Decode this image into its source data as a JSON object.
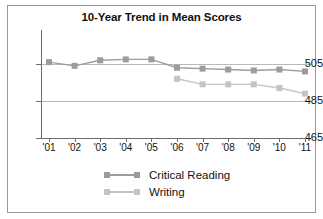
{
  "figure": {
    "title": "10-Year Trend in Mean Scores",
    "background": "#ffffff",
    "border_color": "#9a9a9a"
  },
  "colors": {
    "critical_reading": "#9c9c9c",
    "writing": "#c4c4c4",
    "axis": "#6d6d6d",
    "grid": "#b9b9b9",
    "text": "#111111"
  },
  "legend": {
    "position": "bottom-center",
    "entries": [
      {
        "label": "Critical Reading",
        "color": "#9c9c9c"
      },
      {
        "label": "Writing",
        "color": "#c4c4c4"
      }
    ]
  },
  "axes": {
    "y_ticks": [
      "505",
      "485",
      "465"
    ],
    "x_ticks": [
      "'01",
      "'02",
      "'03",
      "'04",
      "'05",
      "'06",
      "'07",
      "'08",
      "'09",
      "'10",
      "'11"
    ]
  },
  "chart_data": {
    "type": "line",
    "title": "10-Year Trend in Mean Scores",
    "xlabel": "",
    "ylabel": "",
    "categories": [
      "'01",
      "'02",
      "'03",
      "'04",
      "'05",
      "'06",
      "'07",
      "'08",
      "'09",
      "'10",
      "'11"
    ],
    "ylim": [
      465,
      515
    ],
    "y_ticks": [
      465,
      485,
      505
    ],
    "grid": true,
    "legend_position": "bottom-center",
    "series": [
      {
        "name": "Critical Reading",
        "color": "#9c9c9c",
        "marker": "square",
        "values": [
          506,
          504,
          507,
          507.5,
          507.5,
          503,
          502.5,
          502,
          501.5,
          502,
          501
        ]
      },
      {
        "name": "Writing",
        "color": "#c4c4c4",
        "marker": "square",
        "values": [
          null,
          null,
          null,
          null,
          null,
          497,
          494,
          494,
          494,
          492,
          489
        ]
      }
    ]
  }
}
